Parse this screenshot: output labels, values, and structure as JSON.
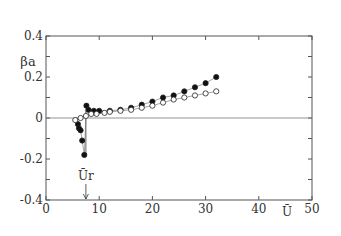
{
  "chart_data": {
    "type": "scatter",
    "title": "",
    "xlabel": "Ū",
    "ylabel": "βa",
    "xlim": [
      0,
      50
    ],
    "ylim": [
      -0.4,
      0.4
    ],
    "xticks": [
      0,
      10,
      20,
      30,
      40,
      50
    ],
    "yticks": [
      -0.4,
      -0.2,
      0,
      0.2,
      0.4
    ],
    "ytick_labels": [
      "-0.4",
      "-0.2",
      "0",
      "0.2",
      "0.4"
    ],
    "grid": false,
    "zero_line": true,
    "annotations": [
      {
        "text": "Ūr",
        "x": 7.5,
        "arrow_to_axis": true
      }
    ],
    "series": [
      {
        "name": "filled",
        "marker": "filled-circle",
        "x": [
          6.0,
          6.2,
          6.5,
          6.8,
          7.2,
          7.6,
          8.0,
          9.0,
          10.0,
          12.0,
          14.0,
          16.0,
          18.0,
          20.0,
          22.0,
          24.0,
          26.0,
          28.0,
          30.0,
          32.0
        ],
        "y": [
          -0.03,
          -0.05,
          -0.06,
          -0.11,
          -0.18,
          0.06,
          0.04,
          0.035,
          0.035,
          0.035,
          0.04,
          0.05,
          0.065,
          0.08,
          0.1,
          0.11,
          0.13,
          0.15,
          0.17,
          0.2
        ]
      },
      {
        "name": "open",
        "marker": "open-circle",
        "x": [
          5.5,
          6.5,
          7.5,
          8.5,
          9.5,
          11.0,
          12.0,
          14.0,
          16.0,
          18.0,
          20.0,
          22.0,
          24.0,
          26.0,
          28.0,
          30.0,
          32.0
        ],
        "y": [
          -0.01,
          0.0,
          0.01,
          0.02,
          0.02,
          0.025,
          0.03,
          0.035,
          0.04,
          0.05,
          0.06,
          0.075,
          0.09,
          0.1,
          0.11,
          0.12,
          0.13
        ]
      }
    ]
  }
}
